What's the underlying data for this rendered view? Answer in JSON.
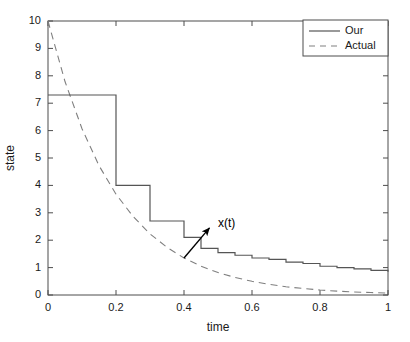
{
  "chart_data": {
    "type": "line",
    "title": "",
    "xlabel": "time",
    "ylabel": "state",
    "xlim": [
      0,
      1
    ],
    "ylim": [
      0,
      10
    ],
    "xticks": [
      0,
      0.2,
      0.4,
      0.6,
      0.8,
      1
    ],
    "xticklabels": [
      "0",
      "0.2",
      "0.4",
      "0.6",
      "0.8",
      "1"
    ],
    "yticks": [
      0,
      1,
      2,
      3,
      4,
      5,
      6,
      7,
      8,
      9,
      10
    ],
    "yticklabels": [
      "0",
      "1",
      "2",
      "3",
      "4",
      "5",
      "6",
      "7",
      "8",
      "9",
      "10"
    ],
    "grid": false,
    "legend_position": "top-right",
    "annotations": [
      {
        "text": "x(t)",
        "x": 0.5,
        "y": 2.6,
        "arrow_tail_x": 0.4,
        "arrow_tail_y": 1.35,
        "arrow_head_x": 0.475,
        "arrow_head_y": 2.45
      }
    ],
    "series": [
      {
        "name": "Our",
        "style": "solid-step",
        "color": "#555555",
        "x": [
          0,
          0.1,
          0.2,
          0.3,
          0.4,
          0.45,
          0.5,
          0.55,
          0.6,
          0.65,
          0.7,
          0.75,
          0.8,
          0.85,
          0.9,
          0.95,
          1
        ],
        "values": [
          7.3,
          7.3,
          4.0,
          2.7,
          2.1,
          1.7,
          1.55,
          1.45,
          1.35,
          1.3,
          1.2,
          1.15,
          1.05,
          1.0,
          0.95,
          0.9,
          0.85
        ]
      },
      {
        "name": "Actual",
        "style": "dashed",
        "color": "#808080",
        "x": [
          0,
          0.05,
          0.1,
          0.15,
          0.2,
          0.25,
          0.3,
          0.35,
          0.4,
          0.45,
          0.5,
          0.55,
          0.6,
          0.65,
          0.7,
          0.75,
          0.8,
          0.85,
          0.9,
          0.95,
          1
        ],
        "values": [
          10.0,
          7.79,
          6.07,
          4.72,
          3.68,
          2.87,
          2.23,
          1.74,
          1.35,
          1.05,
          0.82,
          0.64,
          0.5,
          0.39,
          0.3,
          0.24,
          0.18,
          0.14,
          0.11,
          0.09,
          0.07
        ]
      }
    ],
    "legend_entries": [
      {
        "label": "Our",
        "style": "solid"
      },
      {
        "label": "Actual",
        "style": "dashed"
      }
    ]
  }
}
